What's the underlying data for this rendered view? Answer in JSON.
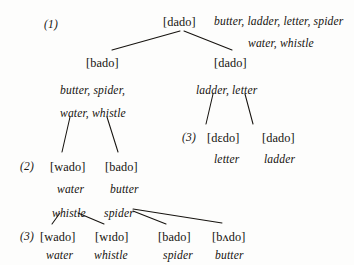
{
  "figure": {
    "type": "phonology-lexical-diffusion-tree",
    "caption": "",
    "ink_color": "#16130f",
    "background_color": "#fdfdfc"
  },
  "stages": [
    {
      "marker": "(1)",
      "x": 44,
      "y": 19
    },
    {
      "marker": "(2)",
      "x": 20,
      "y": 161
    },
    {
      "marker": "(3)",
      "x": 182,
      "y": 132
    },
    {
      "marker": "(3)",
      "x": 20,
      "y": 231
    }
  ],
  "nodes": [
    {
      "id": "root",
      "form": "[dado]",
      "x": 163,
      "y": 16
    },
    {
      "id": "n-bado",
      "form": "[bado]",
      "x": 86,
      "y": 57
    },
    {
      "id": "n-dado",
      "form": "[dado]",
      "x": 214,
      "y": 57
    },
    {
      "id": "n-dedo",
      "form": "[dɛdo]",
      "x": 207,
      "y": 132
    },
    {
      "id": "n-dado2",
      "form": "[dado]",
      "x": 262,
      "y": 132
    },
    {
      "id": "n-wado",
      "form": "[wado]",
      "x": 50,
      "y": 161
    },
    {
      "id": "n-bado2",
      "form": "[bado]",
      "x": 105,
      "y": 161
    },
    {
      "id": "n-wado3",
      "form": "[wado]",
      "x": 40,
      "y": 231
    },
    {
      "id": "n-wido",
      "form": "[wɪdo]",
      "x": 95,
      "y": 231
    },
    {
      "id": "n-bado3",
      "form": "[bado]",
      "x": 158,
      "y": 231
    },
    {
      "id": "n-bvdo",
      "form": "[bʌdo]",
      "x": 212,
      "y": 231
    }
  ],
  "glosses": [
    {
      "id": "g-root-1",
      "text": "butter, ladder, letter, spider",
      "x": 214,
      "y": 16
    },
    {
      "id": "g-root-2",
      "text": "water, whistle",
      "x": 248,
      "y": 38
    },
    {
      "id": "g-bado-1",
      "text": "butter, spider,",
      "x": 60,
      "y": 85
    },
    {
      "id": "g-bado-2",
      "text": "water, whistle",
      "x": 60,
      "y": 108
    },
    {
      "id": "g-dado-1",
      "text": "ladder, letter",
      "x": 196,
      "y": 85
    },
    {
      "id": "g-dedo",
      "text": "letter",
      "x": 214,
      "y": 154
    },
    {
      "id": "g-dado2",
      "text": "ladder",
      "x": 264,
      "y": 154
    },
    {
      "id": "g-wado",
      "text": "water",
      "x": 57,
      "y": 184
    },
    {
      "id": "g-bado2",
      "text": "butter",
      "x": 110,
      "y": 184
    },
    {
      "id": "g-whistle",
      "text": "whistle",
      "x": 52,
      "y": 208
    },
    {
      "id": "g-spider",
      "text": "spider",
      "x": 104,
      "y": 208
    },
    {
      "id": "g-wado3",
      "text": "water",
      "x": 46,
      "y": 250
    },
    {
      "id": "g-wido",
      "text": "whistle",
      "x": 94,
      "y": 250
    },
    {
      "id": "g-bado3",
      "text": "spider",
      "x": 163,
      "y": 250
    },
    {
      "id": "g-bvdo",
      "text": "butter",
      "x": 215,
      "y": 250
    }
  ],
  "edges": [
    {
      "from": "root",
      "to": "n-bado",
      "x1": 180,
      "y1": 31,
      "x2": 112,
      "y2": 50
    },
    {
      "from": "root",
      "to": "n-dado",
      "x1": 184,
      "y1": 31,
      "x2": 232,
      "y2": 50
    },
    {
      "from": "g-bado-2",
      "to": "n-wado",
      "x1": 70,
      "y1": 117,
      "x2": 62,
      "y2": 152
    },
    {
      "from": "g-bado-2",
      "to": "n-bado2",
      "x1": 107,
      "y1": 117,
      "x2": 118,
      "y2": 152
    },
    {
      "from": "g-dado-1",
      "to": "n-dedo",
      "x1": 213,
      "y1": 94,
      "x2": 206,
      "y2": 124
    },
    {
      "from": "g-dado-1",
      "to": "n-dado2",
      "x1": 245,
      "y1": 94,
      "x2": 253,
      "y2": 124
    },
    {
      "from": "g-whistle",
      "to": "n-wado3",
      "x1": 60,
      "y1": 213,
      "x2": 52,
      "y2": 224
    },
    {
      "from": "g-whistle",
      "to": "n-wido",
      "x1": 78,
      "y1": 213,
      "x2": 104,
      "y2": 224
    },
    {
      "from": "g-spider",
      "to": "n-bado3",
      "x1": 133,
      "y1": 211,
      "x2": 166,
      "y2": 224
    },
    {
      "from": "g-spider",
      "to": "n-bvdo",
      "x1": 133,
      "y1": 209,
      "x2": 222,
      "y2": 223
    }
  ]
}
